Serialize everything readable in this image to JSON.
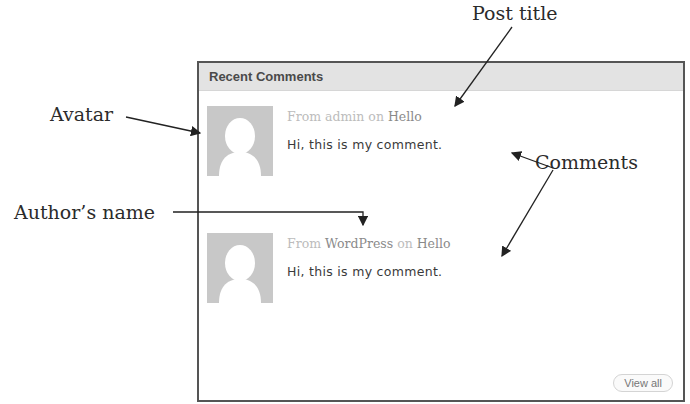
{
  "annotations": {
    "post_title": "Post title",
    "avatar": "Avatar",
    "comments": "Comments",
    "author_name": "Author’s name"
  },
  "widget": {
    "title": "Recent Comments",
    "comments": [
      {
        "from_label": "From",
        "author": "admin",
        "on_label": "on",
        "post": "Hello",
        "text": "Hi, this is my comment."
      },
      {
        "from_label": "From",
        "author": "WordPress",
        "on_label": "on",
        "post": "Hello",
        "text": "Hi, this is my comment."
      }
    ],
    "view_all_label": "View all"
  }
}
